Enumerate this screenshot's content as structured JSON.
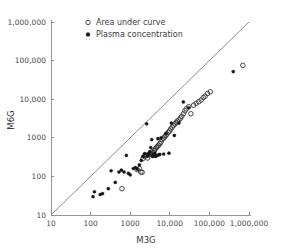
{
  "chart_data": {
    "type": "scatter",
    "title": "",
    "xlabel": "M3G",
    "ylabel": "M6G",
    "xscale": "log",
    "yscale": "log",
    "xlim": [
      10,
      1000000
    ],
    "ylim": [
      10,
      1000000
    ],
    "grid": false,
    "legend_position": "top-left-inside",
    "xticks": [
      10,
      100,
      1000,
      10000,
      100000,
      1000000
    ],
    "xtick_labels": [
      "10",
      "100",
      "1000",
      "10,000",
      "100,000",
      "1,000,000"
    ],
    "yticks": [
      10,
      100,
      1000,
      10000,
      100000,
      1000000
    ],
    "ytick_labels": [
      "10",
      "100",
      "1000",
      "10,000",
      "100,000",
      "1,000,000"
    ],
    "annotations": [
      {
        "name": "identity-line",
        "kind": "reference-line",
        "description": "line of identity y = x",
        "from": [
          10,
          10
        ],
        "to": [
          1000000,
          1000000
        ]
      }
    ],
    "series": [
      {
        "name": "Area under curve",
        "marker": "open-circle",
        "color": "#2e2e2e",
        "points": [
          [
            620,
            48
          ],
          [
            1500,
            150
          ],
          [
            1700,
            160
          ],
          [
            1850,
            130
          ],
          [
            2000,
            128
          ],
          [
            2100,
            290
          ],
          [
            2300,
            330
          ],
          [
            2500,
            345
          ],
          [
            2600,
            360
          ],
          [
            2750,
            300
          ],
          [
            2900,
            355
          ],
          [
            3100,
            380
          ],
          [
            3300,
            400
          ],
          [
            3500,
            430
          ],
          [
            3700,
            360
          ],
          [
            3900,
            420
          ],
          [
            4100,
            470
          ],
          [
            4300,
            520
          ],
          [
            4600,
            560
          ],
          [
            4900,
            600
          ],
          [
            5200,
            640
          ],
          [
            5600,
            700
          ],
          [
            6000,
            780
          ],
          [
            6400,
            900
          ],
          [
            6900,
            980
          ],
          [
            7400,
            1050
          ],
          [
            7900,
            1150
          ],
          [
            8500,
            1250
          ],
          [
            9200,
            1400
          ],
          [
            9900,
            1500
          ],
          [
            10500,
            1700
          ],
          [
            11500,
            1900
          ],
          [
            12500,
            2100
          ],
          [
            13500,
            2300
          ],
          [
            14500,
            2500
          ],
          [
            15500,
            2700
          ],
          [
            17000,
            2900
          ],
          [
            18500,
            3200
          ],
          [
            20000,
            3600
          ],
          [
            22000,
            4200
          ],
          [
            24000,
            5000
          ],
          [
            26000,
            5600
          ],
          [
            30000,
            6400
          ],
          [
            34000,
            4200
          ],
          [
            40000,
            7000
          ],
          [
            46000,
            7800
          ],
          [
            54000,
            8600
          ],
          [
            62000,
            9500
          ],
          [
            70000,
            11000
          ],
          [
            78000,
            12000
          ],
          [
            90000,
            14000
          ],
          [
            105000,
            15500
          ],
          [
            700000,
            75000
          ]
        ]
      },
      {
        "name": "Plasma concentration",
        "marker": "filled-circle",
        "color": "#141414",
        "points": [
          [
            115,
            30
          ],
          [
            125,
            40
          ],
          [
            175,
            34
          ],
          [
            200,
            36
          ],
          [
            280,
            48
          ],
          [
            330,
            140
          ],
          [
            420,
            70
          ],
          [
            520,
            130
          ],
          [
            600,
            145
          ],
          [
            700,
            130
          ],
          [
            800,
            350
          ],
          [
            900,
            120
          ],
          [
            1000,
            110
          ],
          [
            1200,
            160
          ],
          [
            1350,
            170
          ],
          [
            1500,
            155
          ],
          [
            1700,
            200
          ],
          [
            1900,
            260
          ],
          [
            2100,
            330
          ],
          [
            2300,
            390
          ],
          [
            2600,
            2300
          ],
          [
            2700,
            350
          ],
          [
            2900,
            370
          ],
          [
            3100,
            430
          ],
          [
            3300,
            560
          ],
          [
            3500,
            900
          ],
          [
            3700,
            330
          ],
          [
            3900,
            360
          ],
          [
            4100,
            400
          ],
          [
            4300,
            330
          ],
          [
            4500,
            340
          ],
          [
            4700,
            350
          ],
          [
            5000,
            950
          ],
          [
            5200,
            360
          ],
          [
            5600,
            370
          ],
          [
            6000,
            1000
          ],
          [
            7000,
            380
          ],
          [
            8000,
            1300
          ],
          [
            9500,
            400
          ],
          [
            11000,
            2400
          ],
          [
            13000,
            1150
          ],
          [
            17000,
            2400
          ],
          [
            22000,
            8500
          ],
          [
            30000,
            6000
          ],
          [
            400000,
            52000
          ]
        ]
      }
    ]
  },
  "legend": {
    "entries": [
      {
        "label": "Area under curve",
        "marker": "open-circle"
      },
      {
        "label": "Plasma concentration",
        "marker": "filled-circle"
      }
    ]
  }
}
